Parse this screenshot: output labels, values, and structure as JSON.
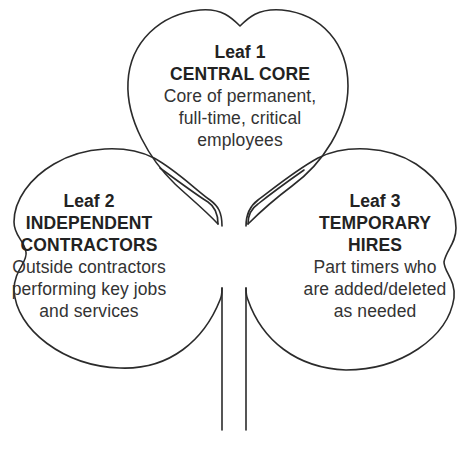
{
  "diagram": {
    "type": "shamrock-organization",
    "leaves": [
      {
        "title": "Leaf 1",
        "name": "CENTRAL CORE",
        "description_lines": [
          "Core of permanent,",
          "full-time, critical",
          "employees"
        ]
      },
      {
        "title": "Leaf 2",
        "name_lines": [
          "INDEPENDENT",
          "CONTRACTORS"
        ],
        "description_lines": [
          "Outside contractors",
          "performing key jobs",
          "and services"
        ]
      },
      {
        "title": "Leaf 3",
        "name_lines": [
          "TEMPORARY",
          "HIRES"
        ],
        "description_lines": [
          "Part timers who",
          "are added/deleted",
          "as needed"
        ]
      }
    ],
    "colors": {
      "stroke": "#2b2b2b",
      "text": "#2a2a2a",
      "background": "#ffffff"
    }
  }
}
